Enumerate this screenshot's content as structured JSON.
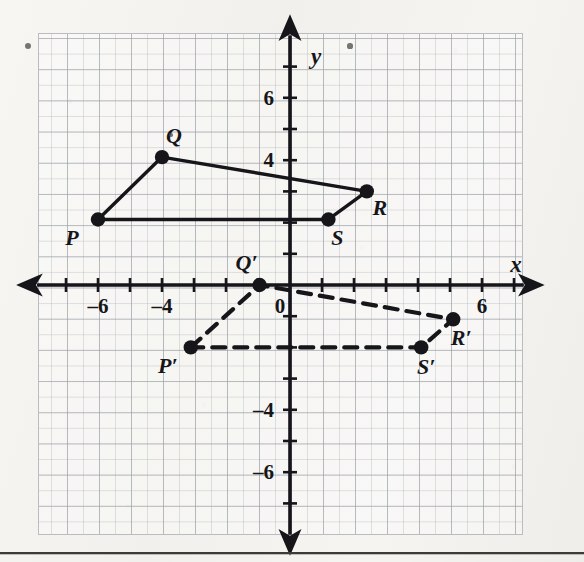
{
  "figure": {
    "type": "coordinate-plane-transformation",
    "axes": {
      "x_axis_label": "x",
      "y_axis_label": "y",
      "origin_label": "0",
      "x_tick_labels": [
        {
          "value": -6,
          "text": "–6"
        },
        {
          "value": -4,
          "text": "–4"
        },
        {
          "value": 6,
          "text": "6"
        }
      ],
      "y_tick_labels": [
        {
          "value": 6,
          "text": "6"
        },
        {
          "value": 4,
          "text": "4"
        },
        {
          "value": -4,
          "text": "–4"
        },
        {
          "value": -6,
          "text": "–6"
        }
      ],
      "x_range": [
        -7.9,
        7.3
      ],
      "y_range": [
        -8.0,
        8.0
      ],
      "grid": true,
      "minor_grid": true
    },
    "shapes": [
      {
        "name": "preimage-quadrilateral-PQRS",
        "style": "solid",
        "color": "#15151a",
        "vertices": [
          {
            "label": "P",
            "x": -6.0,
            "y": 2.1,
            "label_dx": -26,
            "label_dy": 26
          },
          {
            "label": "Q",
            "x": -4.0,
            "y": 4.1,
            "label_dx": 12,
            "label_dy": -14
          },
          {
            "label": "R",
            "x": 2.4,
            "y": 3.0,
            "label_dx": 13,
            "label_dy": 24
          },
          {
            "label": "S",
            "x": 1.2,
            "y": 2.1,
            "label_dx": 9,
            "label_dy": 26
          }
        ]
      },
      {
        "name": "image-quadrilateral-PQRS-prime",
        "style": "dashed",
        "color": "#15151a",
        "vertices": [
          {
            "label": "P′",
            "x": -3.1,
            "y": -2.0,
            "label_dx": -23,
            "label_dy": 26
          },
          {
            "label": "Q′",
            "x": -0.95,
            "y": 0.0,
            "label_dx": -13,
            "label_dy": -15
          },
          {
            "label": "R′",
            "x": 5.1,
            "y": -1.1,
            "label_dx": 8,
            "label_dy": 26
          },
          {
            "label": "S′",
            "x": 4.1,
            "y": -2.0,
            "label_dx": 5,
            "label_dy": 27
          }
        ]
      }
    ],
    "specks": [
      {
        "x": 28,
        "y": 46,
        "r": 3.0
      },
      {
        "x": 350,
        "y": 46,
        "r": 2.6
      },
      {
        "x": 171,
        "y": 135,
        "r": 1.8
      }
    ]
  },
  "chart_data": {
    "type": "scatter",
    "title": "",
    "xlabel": "x",
    "ylabel": "y",
    "xlim": [
      -8,
      7
    ],
    "ylim": [
      -8,
      8
    ],
    "grid": true,
    "legend": "none",
    "series": [
      {
        "name": "PQRS (preimage, solid)",
        "points": [
          {
            "label": "P",
            "x": -6,
            "y": 2
          },
          {
            "label": "Q",
            "x": -4,
            "y": 4
          },
          {
            "label": "R",
            "x": 2.5,
            "y": 3
          },
          {
            "label": "S",
            "x": 1.2,
            "y": 2
          }
        ]
      },
      {
        "name": "P'Q'R'S' (image, dashed)",
        "points": [
          {
            "label": "P'",
            "x": -3,
            "y": -2
          },
          {
            "label": "Q'",
            "x": -1,
            "y": 0
          },
          {
            "label": "R'",
            "x": 5,
            "y": -1
          },
          {
            "label": "S'",
            "x": 4,
            "y": -2
          }
        ]
      }
    ]
  }
}
